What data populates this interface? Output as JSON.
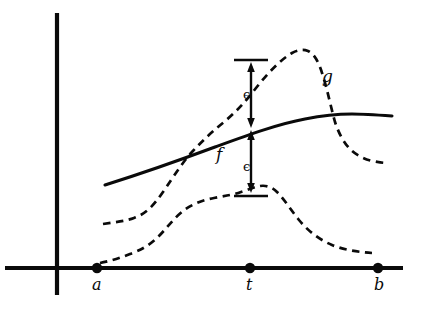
{
  "figure": {
    "background_color": "#ffffff",
    "ink_color": "#0a0a0a",
    "width": 421,
    "height": 315
  },
  "axes": {
    "x_axis_name": "horizontal-axis",
    "y_axis_name": "vertical-axis",
    "x_axis": {
      "x1": 5,
      "y1": 268,
      "x2": 403,
      "y2": 268
    },
    "y_axis": {
      "x1": 57,
      "y1": 13,
      "x2": 57,
      "y2": 295
    }
  },
  "points": [
    {
      "id": "a",
      "label": "a",
      "x": 97,
      "y": 268,
      "label_x": 92,
      "label_y": 277
    },
    {
      "id": "t",
      "label": "t",
      "x": 250,
      "y": 268,
      "label_x": 246,
      "label_y": 277
    },
    {
      "id": "b",
      "label": "b",
      "x": 378,
      "y": 268,
      "label_x": 374,
      "label_y": 277
    }
  ],
  "curves": [
    {
      "id": "f",
      "label": "f",
      "style": "solid",
      "description": "solid increasing concave curve f",
      "label_x": 216,
      "label_y": 146,
      "path": "M 105 185 C 140 174, 180 160, 215 147 C 248 135, 278 124, 305 119 C 325 115, 340 114, 352 114 C 364 114, 378 115, 392 116"
    },
    {
      "id": "g_upper",
      "label": "g",
      "style": "dashed",
      "description": "upper dashed curve g rising to a peak then dropping sharply",
      "label_x": 322,
      "label_y": 68,
      "path": "M 103 224 C 116 222, 126 221, 134 218 C 146 214, 154 205, 163 192 C 174 176, 182 163, 192 152 C 203 140, 213 131, 224 122 C 236 112, 246 101, 256 88 C 268 73, 280 60, 292 53 C 298 50, 303 49, 308 51 C 315 54, 319 63, 323 76 C 328 92, 331 108, 335 122 C 339 134, 344 143, 350 149 C 356 155, 364 159, 372 161 C 378 162, 383 163, 387 163"
    },
    {
      "id": "g_lower",
      "label": "",
      "style": "dashed",
      "description": "lower dashed curve rising to a broad plateau then decaying",
      "label_x": 0,
      "label_y": 0,
      "path": "M 100 263 C 110 261, 120 258, 130 254 C 141 250, 150 245, 158 237 C 167 228, 174 218, 183 211 C 192 204, 203 200, 214 198 C 224 196, 233 195, 241 192 C 248 190, 254 187, 260 186 C 266 185, 272 187, 277 192 C 284 199, 291 210, 299 220 C 309 232, 320 240, 332 245 C 344 250, 358 252, 372 253"
    }
  ],
  "epsilon_annotations": [
    {
      "id": "epsilon-upper",
      "symbol": "ϵ",
      "label_x": 243,
      "label_y": 88,
      "bar_y": 60,
      "bar_x1": 234,
      "bar_x2": 268,
      "arrow_x": 251,
      "arrow_top": 63,
      "arrow_bottom": 127
    },
    {
      "id": "epsilon-lower",
      "symbol": "ϵ",
      "label_x": 243,
      "label_y": 160,
      "bar_y": 196,
      "bar_x1": 234,
      "bar_x2": 268,
      "arrow_x": 251,
      "arrow_top": 130,
      "arrow_bottom": 193
    }
  ]
}
